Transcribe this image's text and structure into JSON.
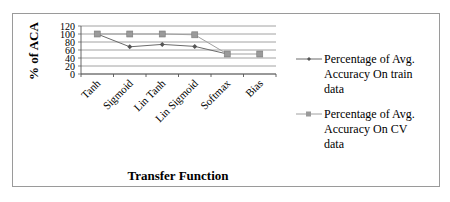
{
  "chart_data": {
    "type": "line",
    "title": "",
    "xlabel": "Transfer Function",
    "ylabel": "% of  ACA",
    "ylim": [
      0,
      120
    ],
    "yticks": [
      "0",
      "20",
      "40",
      "60",
      "80",
      "100",
      "120"
    ],
    "grid": true,
    "legend_position": "right",
    "categories": [
      "Tanh",
      "Sigmoid",
      "Lin Tanh",
      "Lin Sigmoid",
      "Softmax",
      "Bias"
    ],
    "series": [
      {
        "name": "Percentage of Avg. Accuracy On train data",
        "marker": "diamond",
        "color": "#6b6b6b",
        "values": [
          100,
          68,
          74,
          69,
          50,
          null
        ]
      },
      {
        "name": "Percentage of Avg. Accuracy On CV data",
        "marker": "square",
        "color": "#a0a0a0",
        "values": [
          100,
          100,
          100,
          98,
          50,
          50
        ]
      }
    ]
  },
  "legend": {
    "train": [
      "Percentage of Avg.",
      "Accuracy On train",
      "data"
    ],
    "cv": [
      "Percentage of Avg.",
      "Accuracy On CV",
      "data"
    ]
  }
}
